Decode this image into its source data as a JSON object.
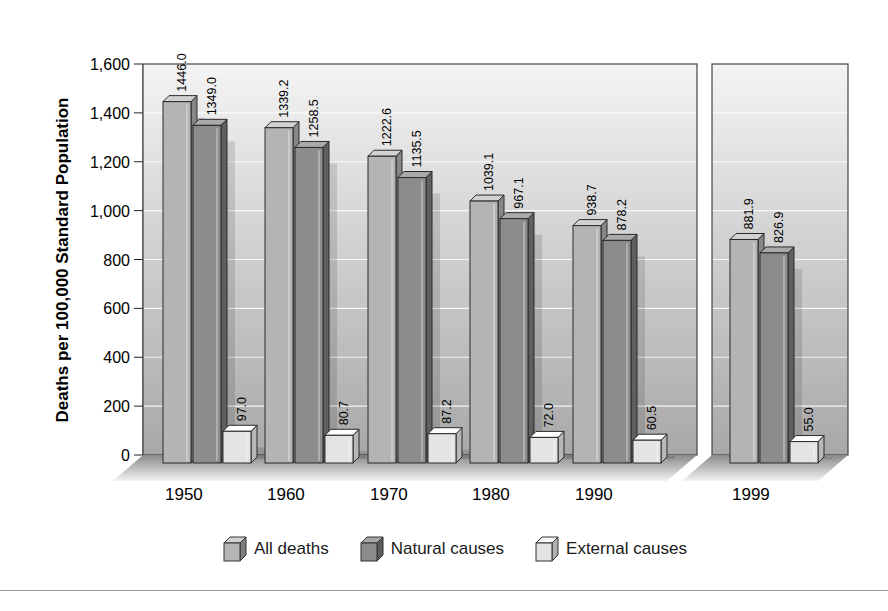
{
  "chart_data": {
    "type": "bar",
    "title": "",
    "xlabel": "",
    "ylabel": "Deaths per 100,000 Standard Population",
    "ylim": [
      0,
      1600
    ],
    "yticks": [
      "0",
      "200",
      "400",
      "600",
      "800",
      "1,000",
      "1,200",
      "1,400",
      "1,600"
    ],
    "grid": true,
    "categories": [
      "1950",
      "1960",
      "1970",
      "1980",
      "1990",
      "1999"
    ],
    "series": [
      {
        "name": "All deaths",
        "values": [
          1446.0,
          1339.2,
          1222.6,
          1039.1,
          938.7,
          881.9
        ],
        "labels": [
          "1446.0",
          "1339.2",
          "1222.6",
          "1039.1",
          "938.7",
          "881.9"
        ],
        "color": "#b4b4b4"
      },
      {
        "name": "Natural causes",
        "values": [
          1349.0,
          1258.5,
          1135.5,
          967.1,
          878.2,
          826.9
        ],
        "labels": [
          "1349.0",
          "1258.5",
          "1135.5",
          "967.1",
          "878.2",
          "826.9"
        ],
        "color": "#8c8c8c"
      },
      {
        "name": "External causes",
        "values": [
          97.0,
          80.7,
          87.2,
          72.0,
          60.5,
          55.0
        ],
        "labels": [
          "97.0",
          "80.7",
          "87.2",
          "72.0",
          "60.5",
          "55.0"
        ],
        "color": "#e4e4e4"
      }
    ],
    "legend_position": "bottom",
    "panels": [
      {
        "categories": [
          "1950",
          "1960",
          "1970",
          "1980",
          "1990"
        ]
      },
      {
        "categories": [
          "1999"
        ]
      }
    ]
  },
  "legend": {
    "items": [
      {
        "label": "All deaths"
      },
      {
        "label": "Natural causes"
      },
      {
        "label": "External causes"
      }
    ]
  }
}
